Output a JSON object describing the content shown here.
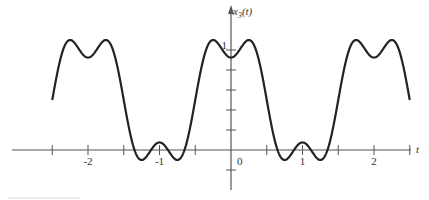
{
  "chart_data": {
    "type": "line",
    "title": "",
    "xlabel": "t",
    "ylabel": "x3(t)",
    "ylabel_parts": {
      "base": "x",
      "sub": "3",
      "arg": "(t)"
    },
    "xlim": [
      -2.5,
      2.5
    ],
    "ylim": [
      -0.4,
      1.4
    ],
    "x_ticks": [
      -2.5,
      -2,
      -1.5,
      -1,
      -0.5,
      0,
      0.5,
      1,
      1.5,
      2,
      2.5
    ],
    "x_tick_labels": [
      {
        "value": -2,
        "label": "-2"
      },
      {
        "value": -1,
        "label": "-1"
      },
      {
        "value": 0,
        "label": "0"
      },
      {
        "value": 1,
        "label": "1"
      },
      {
        "value": 2,
        "label": "2"
      }
    ],
    "y_ticks": [
      -0.2,
      0.2,
      0.4,
      0.6,
      0.8,
      1.0
    ],
    "y_tick_labels": [
      {
        "value": 1,
        "label": "1"
      }
    ],
    "grid": false,
    "legend": null,
    "series": [
      {
        "name": "x3(t)",
        "formula": "0.5 + (2/pi)cos(pi t) - (2/(3pi))cos(3 pi t)",
        "period": 2,
        "x": [
          -2.5,
          -2.25,
          -2.0,
          -1.75,
          -1.5,
          -1.25,
          -1.0,
          -0.75,
          -0.5,
          -0.25,
          0.0,
          0.25,
          0.5,
          0.75,
          1.0,
          1.25,
          1.5,
          1.75,
          2.0,
          2.25,
          2.5
        ],
        "values": [
          0.5,
          1.1,
          0.92,
          1.1,
          0.5,
          -0.1,
          0.08,
          -0.1,
          0.5,
          1.1,
          0.92,
          1.1,
          0.5,
          -0.1,
          0.08,
          -0.1,
          0.5,
          1.1,
          0.92,
          1.1,
          0.5
        ]
      }
    ],
    "colors": {
      "curve": "#222222",
      "axis": "#555555"
    }
  }
}
